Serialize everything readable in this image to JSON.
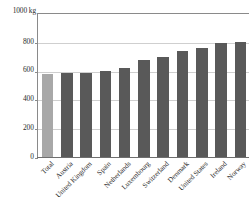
{
  "chart_data": {
    "type": "bar",
    "title": "",
    "subtitle": "",
    "xlabel": "",
    "ylabel": "1000 kg",
    "unit_caption": "1000 kg",
    "ylim": [
      0,
      1000
    ],
    "yticks": [
      0,
      200,
      400,
      600,
      800
    ],
    "ytick_labels": [
      "0",
      "200",
      "400",
      "600",
      "800"
    ],
    "grid": true,
    "legend": "none",
    "categories": [
      "Total",
      "Austria",
      "United Kingdom",
      "Spain",
      "Netherlands",
      "Luxembourg",
      "Switzerland",
      "Denmark",
      "United States",
      "Ireland",
      "Norway"
    ],
    "values": [
      578,
      585,
      586,
      602,
      622,
      678,
      696,
      742,
      760,
      795,
      803
    ],
    "bar_colors": [
      "#a8a8a8",
      "#595959",
      "#595959",
      "#595959",
      "#595959",
      "#595959",
      "#595959",
      "#595959",
      "#595959",
      "#595959",
      "#595959"
    ],
    "highlight_category": "Total",
    "highlight_color": "#a8a8a8",
    "series_color": "#595959",
    "gridline_color": "#cfcfcf",
    "axis_color": "#8a8a8a",
    "background_color": "#ffffff",
    "text_color": "#2b2b2b"
  }
}
